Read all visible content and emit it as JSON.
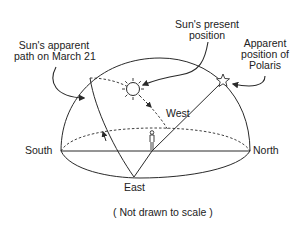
{
  "diagram": {
    "labels": {
      "sun_path_line1": "Sun's apparent",
      "sun_path_line2": "path on March 21",
      "sun_present_line1": "Sun's present",
      "sun_present_line2": "position",
      "polaris_line1": "Apparent",
      "polaris_line2": "position of",
      "polaris_line3": "Polaris",
      "west": "West",
      "south": "South",
      "north": "North",
      "east": "East",
      "caption": "( Not drawn to scale )"
    },
    "icons": {
      "sun": "sun-icon",
      "star": "star-icon",
      "observer": "person-icon"
    },
    "colors": {
      "line": "#2a2a2a",
      "background": "#ffffff"
    }
  }
}
